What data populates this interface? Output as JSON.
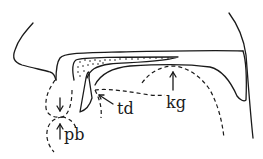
{
  "diagram": {
    "type": "midsagittal vocal tract articulation diagram",
    "labels": {
      "td": "td",
      "kg": "kg",
      "pb": "pb"
    },
    "colors": {
      "ink": "#1a1a1a",
      "background": "#ffffff"
    }
  }
}
